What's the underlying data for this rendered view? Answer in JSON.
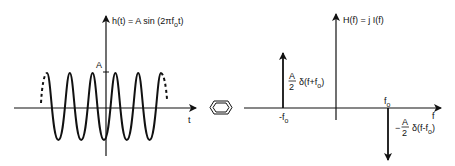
{
  "colors": {
    "ink": "#111111",
    "background": "#ffffff"
  },
  "time_domain": {
    "function_label": "h(t) = A sin (2πf",
    "function_sub": "o",
    "function_tail": "t)",
    "amplitude_label": "A",
    "axis_label": "t"
  },
  "transform_symbol": {
    "icon": "fourier-pair-hexagon-icon"
  },
  "freq_domain": {
    "function_label": "H(f) = j I(f)",
    "axis_label": "f",
    "positive_freq_label": "f",
    "positive_freq_sub": "o",
    "negative_freq_label": "-f",
    "negative_freq_sub": "o",
    "left_impulse": {
      "numerator": "A",
      "denominator": "2",
      "expr": "δ(f+f",
      "expr_sub": "o",
      "expr_tail": ")"
    },
    "right_impulse": {
      "sign": "−",
      "numerator": "A",
      "denominator": "2",
      "expr": "δ(f-f",
      "expr_sub": "o",
      "expr_tail": ")"
    }
  }
}
